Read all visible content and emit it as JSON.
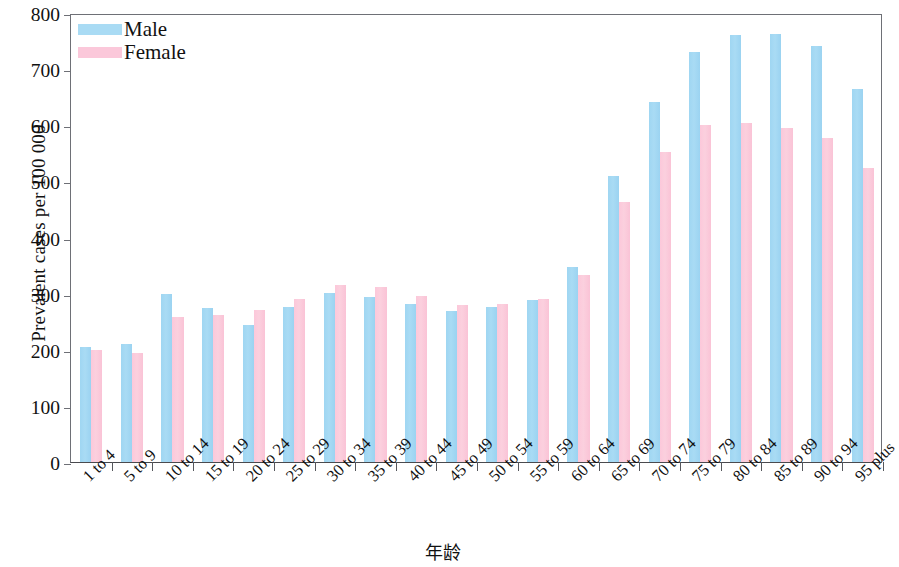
{
  "chart_data": {
    "type": "bar",
    "title": "",
    "subtitle": "",
    "xlabel": "年龄",
    "ylabel": "Prevalent cases per 100 000",
    "ylim": [
      0,
      800
    ],
    "yticks": [
      0,
      100,
      200,
      300,
      400,
      500,
      600,
      700,
      800
    ],
    "grid": false,
    "legend_position": "top-left",
    "categories": [
      "1 to 4",
      "5 to 9",
      "10 to 14",
      "15 to 19",
      "20 to 24",
      "25 to 29",
      "30 to 34",
      "35 to 39",
      "40 to 44",
      "45 to 49",
      "50 to 54",
      "55 to 59",
      "60 to 64",
      "65 to 69",
      "70 to 74",
      "75 to 79",
      "80 to 84",
      "85 to 89",
      "90 to 94",
      "95 plus"
    ],
    "series": [
      {
        "name": "Male",
        "color": "#a9dbf4",
        "values": [
          205,
          211,
          299,
          275,
          245,
          277,
          302,
          294,
          282,
          269,
          276,
          289,
          347,
          510,
          641,
          731,
          760,
          762,
          742,
          664
        ]
      },
      {
        "name": "Female",
        "color": "#fbc8da",
        "values": [
          199,
          194,
          259,
          262,
          271,
          291,
          316,
          311,
          296,
          279,
          281,
          291,
          334,
          464,
          553,
          600,
          604,
          596,
          577,
          523
        ]
      }
    ]
  },
  "legend": {
    "items": [
      {
        "label": "Male",
        "swatch": "male"
      },
      {
        "label": "Female",
        "swatch": "female"
      }
    ]
  }
}
